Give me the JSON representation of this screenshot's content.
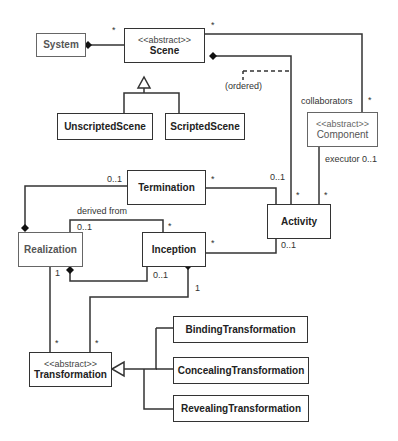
{
  "diagram": {
    "type": "UML class diagram",
    "classes": {
      "system": {
        "name": "System"
      },
      "scene": {
        "stereotype": "<<abstract>>",
        "name": "Scene"
      },
      "unscripted_scene": {
        "name": "UnscriptedScene"
      },
      "scripted_scene": {
        "name": "ScriptedScene"
      },
      "component": {
        "stereotype": "<<abstract>>",
        "name": "Component"
      },
      "termination": {
        "name": "Termination"
      },
      "activity": {
        "name": "Activity"
      },
      "realization": {
        "name": "Realization"
      },
      "inception": {
        "name": "Inception"
      },
      "transformation": {
        "stereotype": "<<abstract>>",
        "name": "Transformation"
      },
      "binding_transformation": {
        "name": "BindingTransformation"
      },
      "concealing_transformation": {
        "name": "ConcealingTransformation"
      },
      "revealing_transformation": {
        "name": "RevealingTransformation"
      }
    },
    "labels": {
      "system_scene_mult": "*",
      "scene_component_mult_scene": "*",
      "scene_component_mult_component": "*",
      "collaborators": "collaborators",
      "ordered": "(ordered)",
      "executor": "executor 0..1",
      "activity_component_mult": "*",
      "activity_scene_mult": "*",
      "termination_realization_mult": "0..1",
      "termination_activity_mult_term": "*",
      "termination_activity_mult_act": "0..1",
      "derived_from": "derived from",
      "derived_realization_mult": "0..1",
      "derived_inception_mult": "*",
      "inception_activity_mult_inc": "*",
      "inception_activity_mult_act": "0..1",
      "realization_transformation_mult_r": "1",
      "inception_realization_mult": "0..1",
      "inception_transformation_mult_i": "1",
      "transformation_mult_1": "*",
      "transformation_mult_2": "*"
    }
  }
}
